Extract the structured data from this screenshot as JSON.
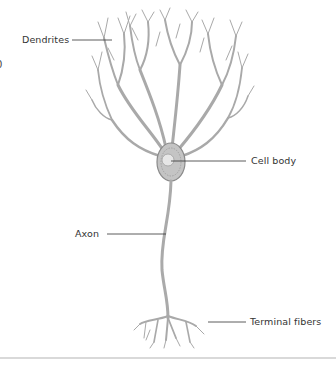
{
  "diagram": {
    "labels": {
      "dendrites": "Dendrites",
      "cell_body": "Cell body",
      "axon": "Axon",
      "terminal_fibers": "Terminal fibers"
    },
    "edge_fragment": "0",
    "colors": {
      "neuron_fill": "#b8b8b8",
      "neuron_stroke": "#8a8a8a",
      "leader_line": "#333333",
      "label_text": "#333333",
      "nucleus": "#e6e6e6"
    }
  }
}
